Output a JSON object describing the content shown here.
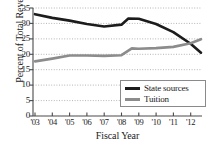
{
  "chart_data": {
    "type": "line",
    "title": "",
    "xlabel": "Fiscal Year",
    "ylabel": "Percent of Total Revenue",
    "categories": [
      "'03",
      "'04",
      "'05",
      "'06",
      "'07",
      "'08",
      "'09",
      "'10",
      "'11",
      "'12"
    ],
    "x": [
      2003,
      2004,
      2005,
      2006,
      2007,
      2008,
      2009,
      2010,
      2011,
      2012
    ],
    "xlim": [
      2003,
      2012.6
    ],
    "ylim": [
      0,
      35
    ],
    "yticks": [
      0,
      5,
      10,
      15,
      20,
      25,
      30,
      35
    ],
    "ytick_labels": [
      "0",
      "5",
      "10",
      "15",
      "20",
      "25",
      "30",
      "35"
    ],
    "grid": true,
    "grid_style": "dotted",
    "legend_position": "bottom-right",
    "series": [
      {
        "name": "State sources",
        "color": "#1c1c1c",
        "values": [
          33.0,
          31.8,
          30.9,
          29.8,
          29.0,
          29.6,
          31.5,
          29.8,
          27.2,
          23.4
        ],
        "extra_points": [
          {
            "x": 2008.4,
            "y": 31.6
          },
          {
            "x": 2012.6,
            "y": 20.5
          }
        ]
      },
      {
        "name": "Tuition",
        "color": "#8c8c8c",
        "values": [
          17.7,
          18.6,
          19.6,
          19.6,
          19.5,
          19.7,
          21.8,
          22.0,
          22.4,
          23.6
        ],
        "extra_points": [
          {
            "x": 2008.6,
            "y": 21.9
          },
          {
            "x": 2012.6,
            "y": 24.9
          }
        ]
      }
    ]
  },
  "legend": {
    "items": [
      {
        "label": "State sources",
        "color": "#1c1c1c"
      },
      {
        "label": "Tuition",
        "color": "#8c8c8c"
      }
    ]
  },
  "axes": {
    "y_title": "Percent of Total Revenue",
    "x_title": "Fiscal Year",
    "y_labels": [
      "35",
      "30",
      "25",
      "20",
      "15",
      "10",
      "5",
      "0"
    ],
    "x_labels": [
      "'03",
      "'04",
      "'05",
      "'06",
      "'07",
      "'08",
      "'09",
      "'10",
      "'11",
      "'12"
    ]
  },
  "colors": {
    "state_sources": "#1c1c1c",
    "tuition": "#8c8c8c",
    "axis": "#4a4a4a",
    "grid": "#b4b4b4",
    "background": "#ffffff"
  }
}
